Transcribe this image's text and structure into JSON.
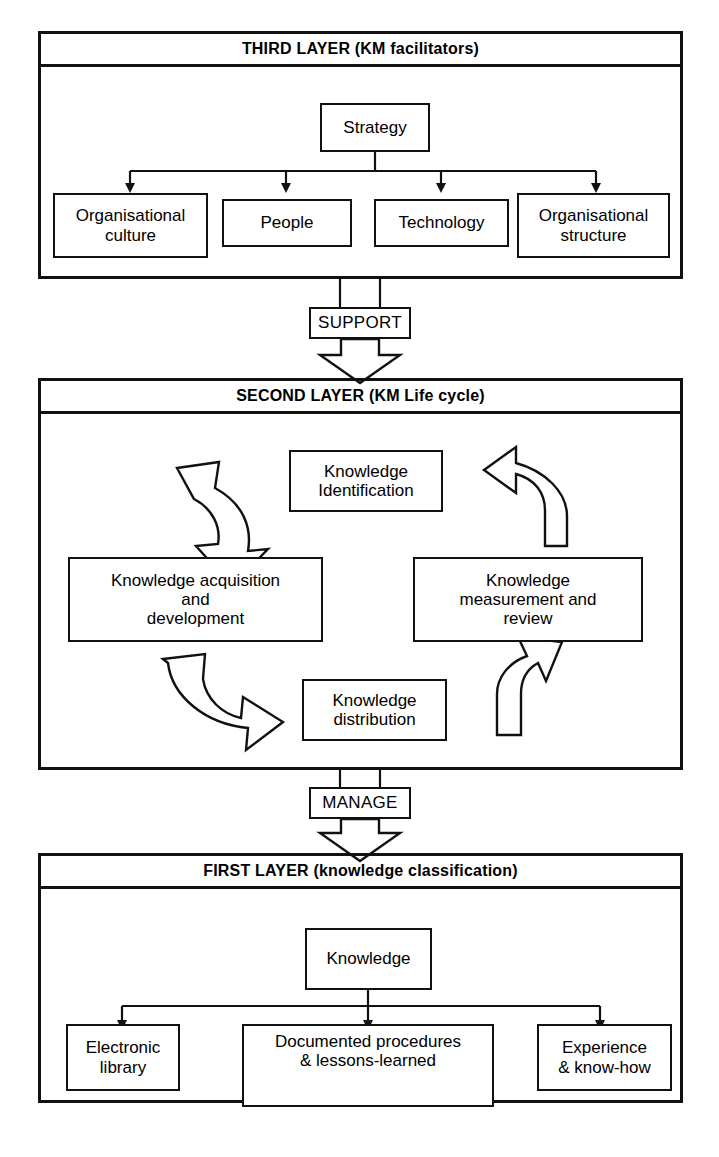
{
  "diagram": {
    "stroke_color": "#111111",
    "background_color": "#ffffff"
  },
  "layers": [
    {
      "id": "third-layer",
      "header": "THIRD LAYER (KM facilitators)",
      "root": "Strategy",
      "children": [
        "Organisational culture",
        "People",
        "Technology",
        "Organisational structure"
      ]
    },
    {
      "id": "second-layer",
      "header": "SECOND LAYER (KM Life cycle)",
      "cycle_nodes": [
        "Knowledge Identification",
        "Knowledge acquisition and development",
        "Knowledge distribution",
        "Knowledge measurement and review"
      ],
      "cycle_node_lines": {
        "identification": [
          "Knowledge",
          "Identification"
        ],
        "acquisition": [
          "Knowledge acquisition",
          "and",
          "development"
        ],
        "distribution": [
          "Knowledge",
          "distribution"
        ],
        "measurement": [
          "Knowledge",
          "measurement and",
          "review"
        ]
      }
    },
    {
      "id": "first-layer",
      "header": "FIRST LAYER (knowledge classification)",
      "root": "Knowledge",
      "children": [
        "Electronic library",
        "Documented procedures & lessons-learned",
        "Experience & know-how"
      ],
      "children_lines": {
        "electronic": [
          "Electronic",
          "library"
        ],
        "documented": [
          "Documented procedures",
          "& lessons-learned"
        ],
        "experience": [
          "Experience",
          "& know-how"
        ]
      }
    }
  ],
  "connectors": [
    {
      "id": "support",
      "label": "SUPPORT",
      "from": "third-layer",
      "to": "second-layer"
    },
    {
      "id": "manage",
      "label": "MANAGE",
      "from": "second-layer",
      "to": "first-layer"
    }
  ]
}
